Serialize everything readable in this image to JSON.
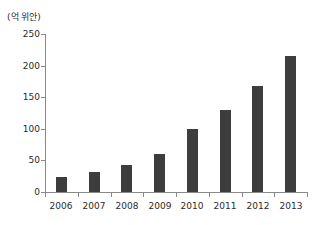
{
  "chart_data": {
    "type": "bar",
    "title": "",
    "unit_label": "(억 위안)",
    "categories": [
      "2006",
      "2007",
      "2008",
      "2009",
      "2010",
      "2011",
      "2012",
      "2013"
    ],
    "values": [
      23,
      31,
      42,
      60,
      100,
      130,
      168,
      215
    ],
    "xlabel": "",
    "ylabel": "(억 위안)",
    "ylim": [
      0,
      250
    ],
    "y_ticks": [
      0,
      50,
      100,
      150,
      200,
      250
    ],
    "grid": false,
    "legend": "none",
    "bar_color": "#3d3d3d",
    "axis_color": "#8a8a8a",
    "text_color": "#2b2b2b",
    "background": "#ffffff"
  }
}
